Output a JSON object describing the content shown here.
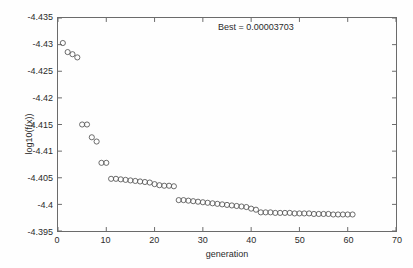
{
  "figure": {
    "background_color": "#fefefe",
    "axis_color": "#6b6b6b",
    "marker_color": "#5a5a5a",
    "text_color": "#2b2b2b"
  },
  "annotation": {
    "best_label": "Best = 0.00003703"
  },
  "axes": {
    "xlabel": "generation",
    "ylabel": "log10(f(x))",
    "xticks": [
      "0",
      "10",
      "20",
      "30",
      "40",
      "50",
      "60",
      "70"
    ],
    "yticks": [
      "-4.395",
      "-4.4",
      "-4.405",
      "-4.41",
      "-4.415",
      "-4.42",
      "-4.425",
      "-4.43",
      "-4.435"
    ]
  },
  "chart_data": {
    "type": "scatter",
    "title": "",
    "annotations": [
      "Best = 0.00003703"
    ],
    "xlabel": "generation",
    "ylabel": "log10(f(x))",
    "xlim": [
      0,
      70
    ],
    "ylim": [
      -4.435,
      -4.395
    ],
    "xticks": [
      0,
      10,
      20,
      30,
      40,
      50,
      60,
      70
    ],
    "yticks": [
      -4.435,
      -4.43,
      -4.425,
      -4.42,
      -4.415,
      -4.41,
      -4.405,
      -4.4,
      -4.395
    ],
    "grid": false,
    "legend": null,
    "marker": "open-circle",
    "series": [
      {
        "name": "best fitness per generation",
        "x": [
          1,
          2,
          3,
          4,
          5,
          6,
          7,
          8,
          9,
          10,
          11,
          12,
          13,
          14,
          15,
          16,
          17,
          18,
          19,
          20,
          21,
          22,
          23,
          24,
          25,
          26,
          27,
          28,
          29,
          30,
          31,
          32,
          33,
          34,
          35,
          36,
          37,
          38,
          39,
          40,
          41,
          42,
          43,
          44,
          45,
          46,
          47,
          48,
          49,
          50,
          51,
          52,
          53,
          54,
          55,
          56,
          57,
          58,
          59,
          60,
          61
        ],
        "y": [
          -4.3997,
          -4.4014,
          -4.4018,
          -4.4024,
          -4.415,
          -4.415,
          -4.4174,
          -4.4182,
          -4.4222,
          -4.4222,
          -4.4252,
          -4.4252,
          -4.4253,
          -4.4254,
          -4.4255,
          -4.4256,
          -4.4257,
          -4.4258,
          -4.4259,
          -4.4262,
          -4.4264,
          -4.4265,
          -4.4265,
          -4.4266,
          -4.4292,
          -4.4292,
          -4.4293,
          -4.4294,
          -4.4295,
          -4.4296,
          -4.4297,
          -4.4298,
          -4.4299,
          -4.43,
          -4.4301,
          -4.4302,
          -4.4303,
          -4.4304,
          -4.4305,
          -4.4308,
          -4.431,
          -4.4315,
          -4.4315,
          -4.4315,
          -4.4316,
          -4.4316,
          -4.4316,
          -4.4316,
          -4.4317,
          -4.4317,
          -4.4317,
          -4.4317,
          -4.4318,
          -4.4318,
          -4.4318,
          -4.4318,
          -4.4319,
          -4.4319,
          -4.4319,
          -4.4319,
          -4.4319
        ]
      }
    ]
  }
}
